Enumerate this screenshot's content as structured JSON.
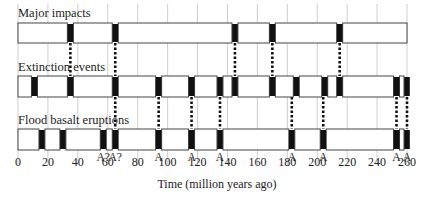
{
  "chart_data": {
    "type": "timeline",
    "title": "",
    "xlabel": "Time (million years ago)",
    "ylabel": "",
    "xlim": [
      0,
      260
    ],
    "x_ticks": [
      0,
      20,
      40,
      60,
      80,
      100,
      120,
      140,
      160,
      180,
      200,
      220,
      240,
      260
    ],
    "grid": true,
    "rows": [
      {
        "name": "Major impacts",
        "events": [
          35,
          65,
          145,
          170,
          215
        ]
      },
      {
        "name": "Extinction events",
        "events": [
          11,
          35,
          65,
          94,
          116,
          135,
          145,
          170,
          186,
          205,
          215,
          253,
          260
        ]
      },
      {
        "name": "Flood basalt eruptions",
        "events": [
          16,
          30,
          57,
          65,
          94,
          116,
          135,
          183,
          204,
          253,
          260
        ]
      }
    ],
    "links": [
      {
        "from_row": 0,
        "to_row": 1,
        "times": [
          35,
          65,
          145,
          170,
          215
        ]
      },
      {
        "from_row": 1,
        "to_row": 2,
        "times": [
          65,
          94,
          116,
          135,
          183,
          204,
          253,
          260
        ]
      }
    ],
    "annotations": [
      {
        "x": 57,
        "text": "A?"
      },
      {
        "x": 65,
        "text": "A?"
      },
      {
        "x": 94,
        "text": "A"
      },
      {
        "x": 116,
        "text": "A"
      },
      {
        "x": 135,
        "text": "A"
      },
      {
        "x": 183,
        "text": "A"
      },
      {
        "x": 204,
        "text": "A"
      },
      {
        "x": 253,
        "text": "A"
      },
      {
        "x": 260,
        "text": "A"
      }
    ]
  },
  "labels": {
    "row0": "Major impacts",
    "row1": "Extinction events",
    "row2": "Flood basalt eruptions",
    "xaxis": "Time (million years ago)"
  }
}
